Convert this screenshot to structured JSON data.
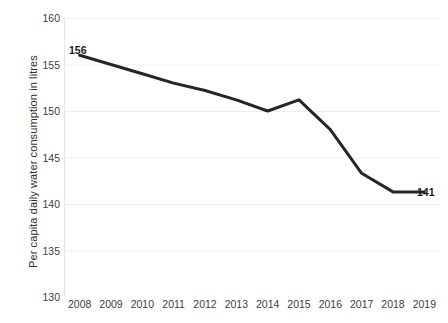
{
  "chart_data": {
    "type": "line",
    "title": "",
    "xlabel": "",
    "ylabel": "Per capita daily water consumption in litres",
    "categories": [
      "2008",
      "2009",
      "2010",
      "2011",
      "2012",
      "2013",
      "2014",
      "2015",
      "2016",
      "2017",
      "2018",
      "2019"
    ],
    "values": [
      156,
      155,
      154,
      153,
      152.2,
      151.2,
      150,
      151.2,
      148,
      143.3,
      141.3,
      141.3
    ],
    "ylim": [
      130,
      160
    ],
    "yticks": [
      130,
      135,
      140,
      145,
      150,
      155,
      160
    ],
    "ytick_labels": [
      "130",
      "135",
      "140",
      "145",
      "150",
      "155",
      "160"
    ],
    "grid": true,
    "grid_axis": "y",
    "legend": false,
    "legend_position": "none",
    "series": [
      {
        "name": "Per capita daily water consumption",
        "values": [
          156,
          155,
          154,
          153,
          152.2,
          151.2,
          150,
          151.2,
          148,
          143.3,
          141.3,
          141.3
        ],
        "color": "#262626",
        "line_width": 3,
        "markers": false
      }
    ],
    "annotations": [
      {
        "name": "first-point-value",
        "text": "156",
        "year": "2008",
        "value": 156,
        "position": "above-left"
      },
      {
        "name": "last-point-value",
        "text": "141",
        "year": "2019",
        "value": 141,
        "position": "right"
      }
    ],
    "colors": {
      "line": "#262626",
      "grid": "#efefef",
      "axis": "#e3e3e3",
      "tick_text": "#404040",
      "label_text": "#1a1a1a",
      "background": "#ffffff"
    }
  },
  "watermark": {
    "text": ""
  }
}
